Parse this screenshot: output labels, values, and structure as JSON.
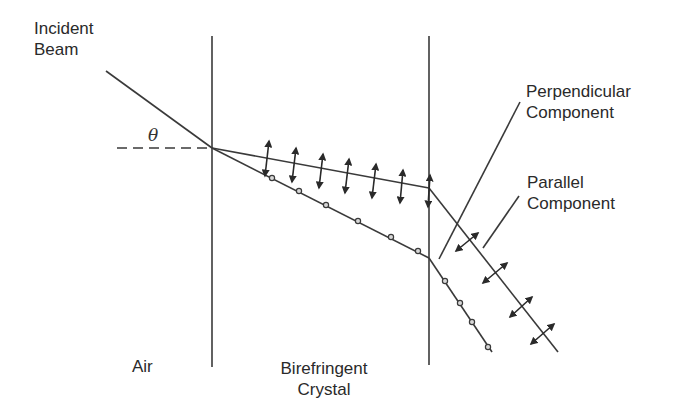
{
  "labels": {
    "incident_beam": [
      "Incident",
      "Beam"
    ],
    "theta": "θ",
    "perpendicular_component": [
      "Perpendicular",
      "Component"
    ],
    "parallel_component": [
      "Parallel",
      "Component"
    ],
    "air": "Air",
    "birefringent_crystal": [
      "Birefringent",
      "Crystal"
    ]
  },
  "colors": {
    "line": "#3a3a3a",
    "text": "#2a2a2a",
    "background": "#ffffff"
  }
}
